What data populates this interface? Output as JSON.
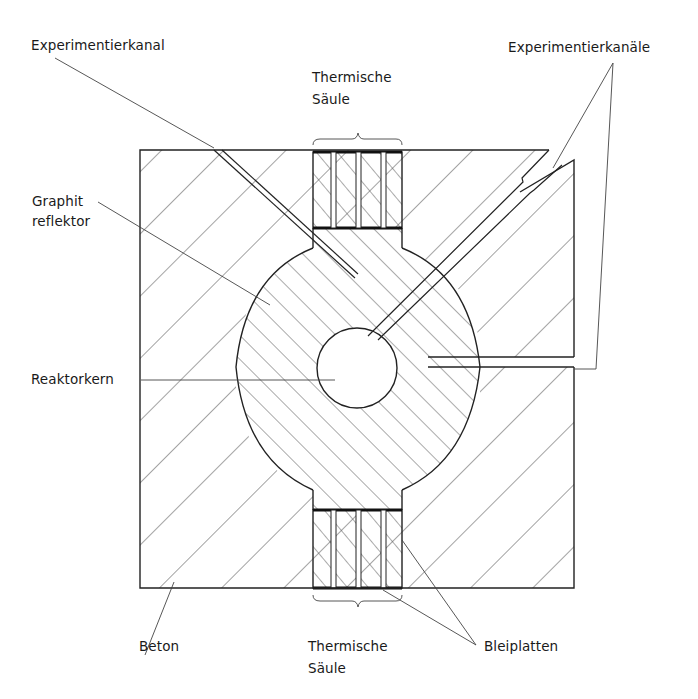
{
  "labels": {
    "experimentierkanal": "Experimentierkanal",
    "experimentierkanaele": "Experimentierkanäle",
    "thermische_saeule_top_line1": "Thermische",
    "thermische_saeule_top_line2": "Säule",
    "graphit_line1": "Graphit",
    "graphit_line2": "reflektor",
    "reaktorkern": "Reaktorkern",
    "beton": "Beton",
    "thermische_saeule_bottom_line1": "Thermische",
    "thermische_saeule_bottom_line2": "Säule",
    "bleiplatten": "Bleiplatten"
  },
  "components": [
    {
      "name": "Beton",
      "role": "concrete shield",
      "hatch": "diagonal /"
    },
    {
      "name": "Graphitreflektor",
      "role": "graphite reflector",
      "hatch": "diagonal \\"
    },
    {
      "name": "Reaktorkern",
      "role": "reactor core",
      "hatch": "none"
    },
    {
      "name": "Thermische Säule",
      "count": 2,
      "position": [
        "top",
        "bottom"
      ]
    },
    {
      "name": "Bleiplatten",
      "role": "lead plates"
    },
    {
      "name": "Experimentierkanal",
      "count": 1
    },
    {
      "name": "Experimentierkanäle",
      "count": 2
    }
  ],
  "colors": {
    "line": "#222222",
    "hatch": "#555555",
    "background": "#ffffff"
  }
}
